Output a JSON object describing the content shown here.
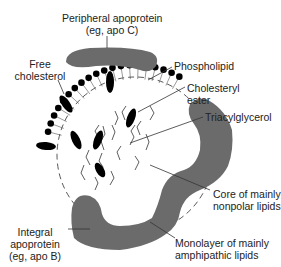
{
  "labels": {
    "peripheral": {
      "line1": "Peripheral apoprotein",
      "line2": "(eg, apo C)"
    },
    "free_cholesterol": {
      "line1": "Free",
      "line2": "cholesterol"
    },
    "phospholipid": {
      "line1": "Phospholipid"
    },
    "cholesteryl_ester": {
      "line1": "Cholesteryl",
      "line2": "ester"
    },
    "triacylglycerol": {
      "line1": "Triacylglycerol"
    },
    "core": {
      "line1": "Core of mainly",
      "line2": "nonpolar lipids"
    },
    "integral": {
      "line1": "Integral",
      "line2": "apoprotein",
      "line3": "(eg, apo B)"
    },
    "monolayer": {
      "line1": "Monolayer of mainly",
      "line2": "amphipathic lipids"
    }
  },
  "colors": {
    "protein": "#6b6b6b",
    "lipid_head": "#000000",
    "line": "#333333"
  }
}
